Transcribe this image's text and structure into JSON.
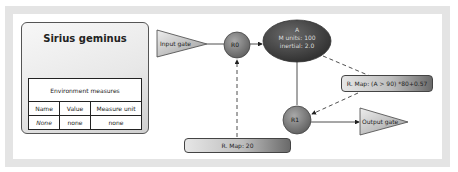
{
  "panel": {
    "title": "Sirius geminus",
    "table": {
      "caption": "Environment measures",
      "columns": [
        "Name",
        "Value",
        "Measure unit"
      ],
      "rows": [
        [
          "None",
          "none",
          "none"
        ]
      ]
    }
  },
  "diagram": {
    "input_gate": "Input gate",
    "r0": "R0",
    "ellipse": {
      "line1": "A",
      "line2": "M units: 100",
      "line3": "inertial: 2.0"
    },
    "r1": "R1",
    "output_gate": "Output gate",
    "rmap_upper": "R. Map: (A > 90) *80+0.57",
    "rmap_lower": "R. Map: 20"
  },
  "colors": {
    "frame": "#e4e4e4",
    "node_fill": "#7d7d7d",
    "ellipse_fill": "#4a4a4a",
    "triangle_fill": "#bdbdbd"
  }
}
